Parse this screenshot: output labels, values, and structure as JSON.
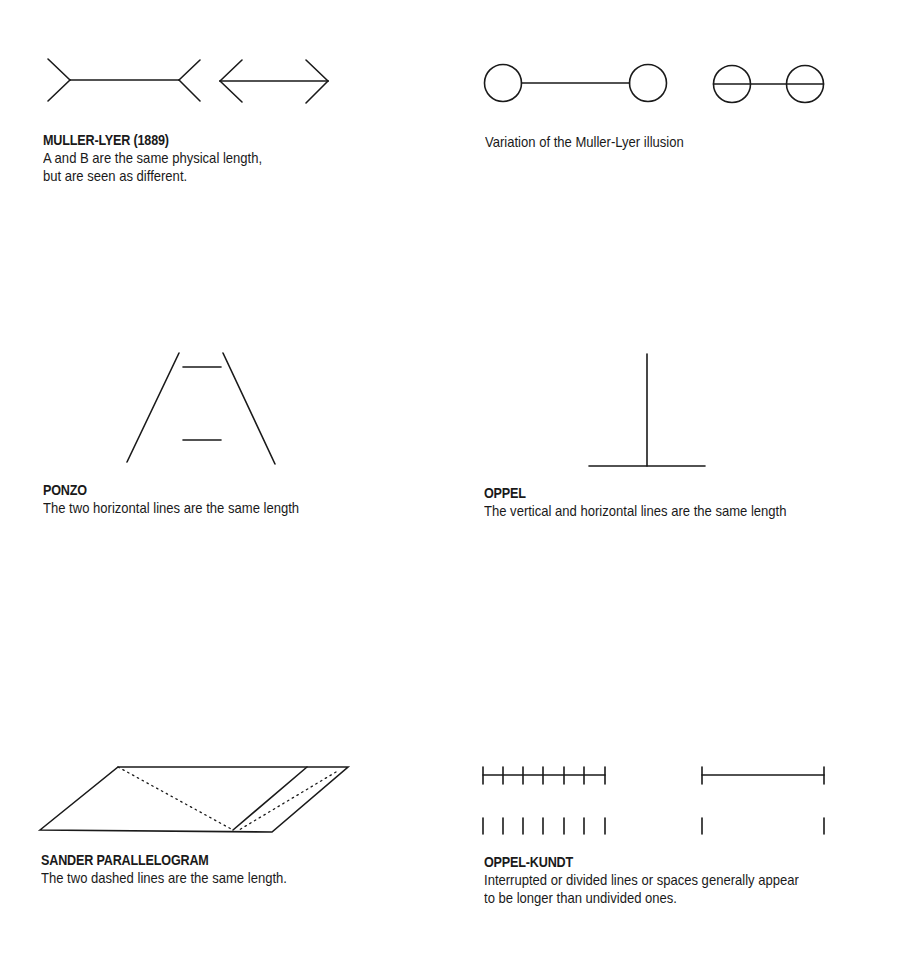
{
  "panels": [
    {
      "id": "muller-lyer",
      "title": "MULLER-LYER (1889)",
      "desc_lines": [
        "A and B are the same physical length,",
        "but are seen as different."
      ]
    },
    {
      "id": "muller-lyer-variation",
      "title": "",
      "desc_lines": [
        "Variation of the Muller-Lyer illusion"
      ]
    },
    {
      "id": "ponzo",
      "title": "PONZO",
      "desc_lines": [
        "The two horizontal lines  are the same length"
      ]
    },
    {
      "id": "oppel",
      "title": "OPPEL",
      "desc_lines": [
        "The vertical and horizontal lines  are the same length"
      ]
    },
    {
      "id": "sander",
      "title": "SANDER PARALLELOGRAM",
      "desc_lines": [
        "The two dashed lines are the same length."
      ]
    },
    {
      "id": "oppel-kundt",
      "title": "OPPEL-KUNDT",
      "desc_lines": [
        "Interrupted or divided lines or spaces generally appear",
        "to be longer than undivided ones."
      ]
    }
  ],
  "colors": {
    "stroke": "#1a1a1a",
    "background": "#ffffff"
  }
}
